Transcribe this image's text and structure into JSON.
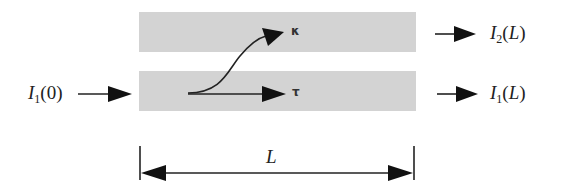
{
  "diagram": {
    "colors": {
      "waveguide": "#d3d3d3",
      "stroke": "#222222"
    },
    "waveguides": [
      {
        "name": "upper",
        "x": 139,
        "y": 12,
        "w": 277,
        "h": 40
      },
      {
        "name": "lower",
        "x": 139,
        "y": 71,
        "w": 277,
        "h": 40
      }
    ],
    "input": {
      "symbol": "I",
      "sub": "1",
      "arg": "0"
    },
    "outputs": [
      {
        "symbol": "I",
        "sub": "2",
        "arg": "L"
      },
      {
        "symbol": "I",
        "sub": "1",
        "arg": "L"
      }
    ],
    "coefficients": {
      "cross": "κ",
      "through": "τ"
    },
    "length_label": "L"
  }
}
